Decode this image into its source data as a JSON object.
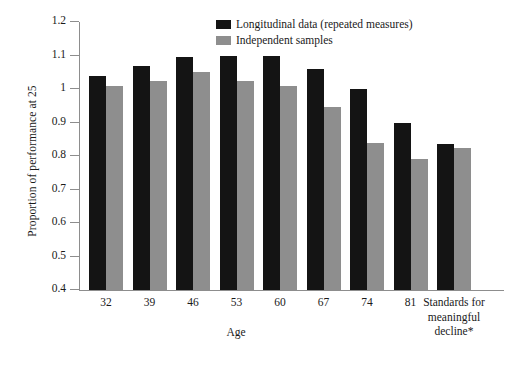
{
  "chart_data": {
    "type": "bar",
    "title": "",
    "xlabel": "Age",
    "ylabel": "Proportion of performance at 25",
    "ylim": [
      0.4,
      1.2
    ],
    "ytick_values": [
      1.2,
      1.1,
      1,
      0.9,
      0.8,
      0.7,
      0.6,
      0.5,
      0.4
    ],
    "ytick_labels": [
      "1.2",
      "1.1",
      "1",
      "0.9",
      "0.8",
      "0.7",
      "0.6",
      "0.5",
      "0.4"
    ],
    "grid": false,
    "legend_position": "top-center",
    "categories": [
      "32",
      "39",
      "46",
      "53",
      "60",
      "67",
      "74",
      "81",
      "Standards for meaningful decline*"
    ],
    "category_labels": [
      {
        "text": "32",
        "multiline": false
      },
      {
        "text": "39",
        "multiline": false
      },
      {
        "text": "46",
        "multiline": false
      },
      {
        "text": "53",
        "multiline": false
      },
      {
        "text": "60",
        "multiline": false
      },
      {
        "text": "67",
        "multiline": false
      },
      {
        "text": "74",
        "multiline": false
      },
      {
        "text": "81",
        "multiline": false
      },
      {
        "text": "Standards for meaningful decline*",
        "multiline": true
      }
    ],
    "series": [
      {
        "name": "Longitudinal data (repeated measures)",
        "color": "#141414",
        "values": [
          1.04,
          1.07,
          1.095,
          1.1,
          1.1,
          1.06,
          1.0,
          0.9,
          0.835
        ]
      },
      {
        "name": "Independent samples",
        "color": "#8e8e8e",
        "values": [
          1.01,
          1.025,
          1.05,
          1.025,
          1.01,
          0.945,
          0.84,
          0.79,
          0.825
        ]
      }
    ]
  },
  "legend": {
    "items": [
      {
        "label": "Longitudinal data (repeated measures)",
        "swatch": "dark"
      },
      {
        "label": "Independent samples",
        "swatch": "light"
      }
    ]
  },
  "axes": {
    "y_title": "Proportion of performance at 25",
    "x_title": "Age"
  }
}
